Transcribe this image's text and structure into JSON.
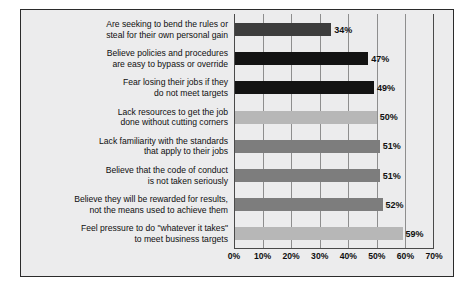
{
  "figure": {
    "caption": "FIGURE 2.7  Root causes of misconduct",
    "caption_clipped": true
  },
  "chart_data": {
    "type": "bar",
    "orientation": "horizontal",
    "xlabel": "",
    "ylabel": "",
    "xlim": [
      0,
      70
    ],
    "xticks": [
      "0%",
      "10%",
      "20%",
      "30%",
      "40%",
      "50%",
      "60%",
      "70%"
    ],
    "xtick_values": [
      0,
      10,
      20,
      30,
      40,
      50,
      60,
      70
    ],
    "grid": true,
    "legend": false,
    "value_suffix": "%",
    "categories": [
      "Are seeking to bend the rules or steal for their own personal gain",
      "Believe policies and procedures are easy to bypass or override",
      "Fear losing their jobs if they do not meet targets",
      "Lack resources to get the job done without cutting corners",
      "Lack familiarity with the standards that apply to their jobs",
      "Believe that the code of conduct is not taken seriously",
      "Believe they will be rewarded for results, not the means used to achieve them",
      "Feel pressure to do \"whatever it takes\" to meet business targets"
    ],
    "category_lines": [
      [
        "Are seeking to bend the rules or",
        "steal for their own personal gain"
      ],
      [
        "Believe policies and procedures",
        "are easy to bypass or override"
      ],
      [
        "Fear losing their jobs if they",
        "do not meet targets"
      ],
      [
        "Lack resources to get the job",
        "done without cutting corners"
      ],
      [
        "Lack familiarity with the standards",
        "that apply to their jobs"
      ],
      [
        "Believe that the code of conduct",
        "is not taken seriously"
      ],
      [
        "Believe they will be rewarded for results,",
        "not the means used to achieve them"
      ],
      [
        "Feel pressure to do \"whatever it takes\"",
        "to meet business targets"
      ]
    ],
    "values": [
      34,
      47,
      49,
      50,
      51,
      51,
      52,
      59
    ],
    "value_labels": [
      "34%",
      "47%",
      "49%",
      "50%",
      "51%",
      "51%",
      "52%",
      "59%"
    ],
    "bar_colors": [
      "#3d3d3d",
      "#131313",
      "#131313",
      "#b7b7b7",
      "#7d7d7d",
      "#7d7d7d",
      "#7d7d7d",
      "#b7b7b7"
    ]
  },
  "style": {
    "panel_background": "#ececed",
    "page_background": "#ffffff",
    "frame_color": "#2b2b2b",
    "axis_color": "#4a4a4a",
    "gridline_color": "#8e8e8e",
    "text_color": "#0f0f0f"
  }
}
